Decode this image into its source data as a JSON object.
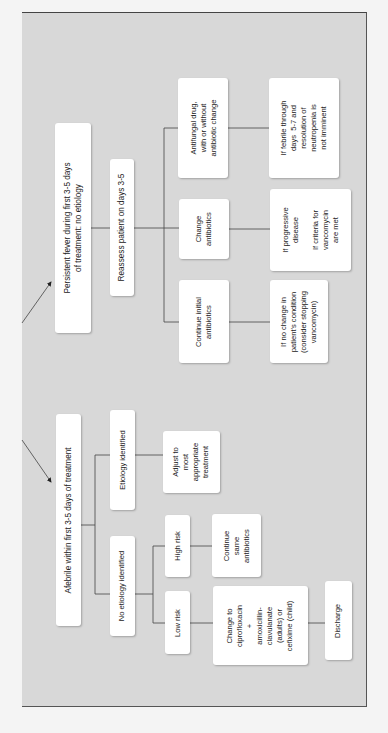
{
  "diagram": {
    "orientation": "rotated 90 degrees counter-clockwise",
    "colors": {
      "frame_bg": "#d8d8d8",
      "box_bg": "#ffffff",
      "line": "#444444"
    },
    "branches": {
      "persistent": {
        "root": "Persistent fever during first 3-5 days\nof treatment: no etiology",
        "reassess": "Reassess patient on days 3-5",
        "options": [
          {
            "action": "Antifungal drug,\nwith or without\nantibiotic change",
            "condition": "If febrile through\ndays  5-7 and\nresolution of\nneutropenia is\nnot imminent"
          },
          {
            "action": "Change\nantibiotics",
            "condition": "If progressive\ndisease\n\nIf criteria for\nvancomycin\nare met"
          },
          {
            "action": "Continue initial\nantibiotics",
            "condition": "If no change in\npatient's condition\n(consider stopping\nvancomycin)"
          }
        ]
      },
      "afebrile": {
        "root": "Afebrile within first 3-5 days of treatment",
        "etiology_identified": "Etiology identified",
        "adjust": "Adjust to\nmost\nappropriate\ntreatment",
        "no_etiology": "No etiology identified",
        "high_risk": "High risk",
        "continue_same": "Continue\nsame\nantibiotics",
        "low_risk": "Low risk",
        "change_to": "Change to\nciprofloxacin\n+\namoxicillin-\nclavulanate\n(adults) or\ncefixime (child)",
        "discharge": "Discharge"
      }
    }
  }
}
